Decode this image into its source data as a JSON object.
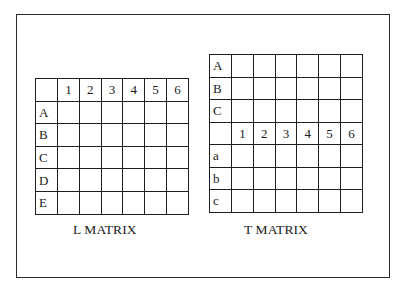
{
  "figure": {
    "matrices": [
      {
        "id": "l-matrix",
        "caption": "L MATRIX",
        "column_headers": [
          "",
          "1",
          "2",
          "3",
          "4",
          "5",
          "6"
        ],
        "row_labels": [
          "A",
          "B",
          "C",
          "D",
          "E"
        ]
      },
      {
        "id": "t-matrix",
        "caption": "T MATRIX",
        "upper_row_labels": [
          "A",
          "B",
          "C"
        ],
        "column_headers": [
          "",
          "1",
          "2",
          "3",
          "4",
          "5",
          "6"
        ],
        "lower_row_labels": [
          "a",
          "b",
          "c"
        ]
      }
    ]
  },
  "l": {
    "caption": "L MATRIX",
    "cols": [
      "",
      "1",
      "2",
      "3",
      "4",
      "5",
      "6"
    ],
    "rows": [
      "A",
      "B",
      "C",
      "D",
      "E"
    ]
  },
  "t": {
    "caption": "T MATRIX",
    "upper_rows": [
      "A",
      "B",
      "C"
    ],
    "cols": [
      "",
      "1",
      "2",
      "3",
      "4",
      "5",
      "6"
    ],
    "lower_rows": [
      "a",
      "b",
      "c"
    ]
  },
  "colors": {
    "line": "#1e1e1e",
    "frame": "#2b2b2b",
    "background": "#ffffff",
    "text": "#1a1a1a"
  }
}
